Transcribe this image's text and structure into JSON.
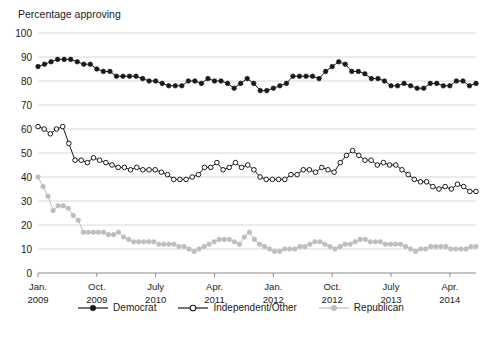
{
  "chart_data": {
    "type": "line",
    "title": "",
    "ylabel": "Percentage approving",
    "xlabel": "",
    "ylim": [
      0,
      100
    ],
    "ytick_values": [
      0,
      10,
      20,
      30,
      40,
      50,
      60,
      70,
      80,
      90,
      100
    ],
    "ytick_labels": [
      "0",
      "10",
      "20",
      "30",
      "40",
      "50",
      "60",
      "70",
      "80",
      "90",
      "100"
    ],
    "grid": true,
    "grid_axis": "y",
    "legend_position": "bottom",
    "xtick_labels": [
      {
        "month": "Jan.",
        "year": "2009",
        "index": 0
      },
      {
        "month": "Oct.",
        "year": "2009",
        "index": 9
      },
      {
        "month": "July",
        "year": "2010",
        "index": 18
      },
      {
        "month": "Apr.",
        "year": "2011",
        "index": 27
      },
      {
        "month": "Jan.",
        "year": "2012",
        "index": 36
      },
      {
        "month": "Oct.",
        "year": "2012",
        "index": 45
      },
      {
        "month": "July",
        "year": "2013",
        "index": 54
      },
      {
        "month": "Apr.",
        "year": "2014",
        "index": 63
      }
    ],
    "x_index_range": [
      0,
      67
    ],
    "series": [
      {
        "name": "Democrat",
        "color": "#1a1a1a",
        "marker": "filled-circle",
        "values": [
          86,
          87,
          88,
          89,
          89,
          89,
          88,
          87,
          87,
          85,
          84,
          84,
          82,
          82,
          82,
          82,
          81,
          80,
          80,
          79,
          78,
          78,
          78,
          80,
          80,
          79,
          81,
          80,
          80,
          79,
          77,
          79,
          81,
          79,
          76,
          76,
          77,
          78,
          79,
          82,
          82,
          82,
          82,
          81,
          84,
          86,
          88,
          87,
          84,
          84,
          83,
          81,
          81,
          80,
          78,
          78,
          79,
          78,
          77,
          77,
          79,
          79,
          78,
          78,
          80,
          80,
          78,
          79
        ]
      },
      {
        "name": "Independent/Other",
        "color": "#1a1a1a",
        "marker": "open-circle",
        "values": [
          61,
          60,
          58,
          60,
          61,
          54,
          47,
          47,
          46,
          48,
          47,
          46,
          45,
          44,
          44,
          43,
          44,
          43,
          43,
          43,
          42,
          41,
          39,
          39,
          39,
          40,
          41,
          44,
          44,
          46,
          43,
          44,
          46,
          44,
          45,
          43,
          40,
          39,
          39,
          39,
          39,
          41,
          41,
          43,
          43,
          42,
          44,
          43,
          42,
          46,
          49,
          51,
          49,
          47,
          47,
          45,
          46,
          45,
          45,
          43,
          41,
          39,
          38,
          38,
          36,
          35,
          36,
          35,
          37,
          36,
          34,
          34
        ]
      },
      {
        "name": "Republican",
        "color": "#bdbdbd",
        "marker": "filled-circle-light",
        "values": [
          40,
          36,
          32,
          26,
          28,
          28,
          27,
          24,
          22,
          17,
          17,
          17,
          17,
          17,
          16,
          16,
          17,
          15,
          14,
          13,
          13,
          13,
          13,
          13,
          12,
          12,
          12,
          12,
          11,
          11,
          10,
          9,
          10,
          11,
          12,
          13,
          14,
          14,
          14,
          13,
          12,
          15,
          17,
          14,
          12,
          11,
          10,
          9,
          9,
          10,
          10,
          10,
          11,
          11,
          12,
          13,
          13,
          12,
          11,
          10,
          11,
          12,
          12,
          13,
          14,
          14,
          13,
          13,
          13,
          12,
          12,
          12,
          12,
          11,
          10,
          9,
          10,
          10,
          11,
          11,
          11,
          11,
          10,
          10,
          10,
          10,
          11,
          11
        ]
      }
    ]
  },
  "legend": {
    "items": [
      {
        "label": "Democrat",
        "marker": "filled-circle",
        "color": "#1a1a1a"
      },
      {
        "label": "Independent/Other",
        "marker": "open-circle",
        "color": "#1a1a1a"
      },
      {
        "label": "Republican",
        "marker": "filled-circle-light",
        "color": "#bdbdbd"
      }
    ]
  }
}
